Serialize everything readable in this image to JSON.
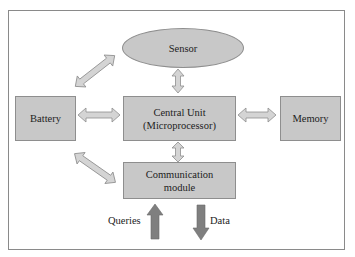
{
  "diagram": {
    "title": "",
    "nodes": {
      "sensor": "Sensor",
      "battery": "Battery",
      "central_unit_line1": "Central Unit",
      "central_unit_line2": "(Microprocessor)",
      "memory": "Memory",
      "comm_line1": "Communication",
      "comm_line2": "module"
    },
    "io_labels": {
      "queries": "Queries",
      "data": "Data"
    },
    "edges": [
      {
        "from": "Battery",
        "to": "Sensor",
        "type": "bidirectional"
      },
      {
        "from": "Battery",
        "to": "Central Unit",
        "type": "bidirectional"
      },
      {
        "from": "Battery",
        "to": "Communication module",
        "type": "bidirectional"
      },
      {
        "from": "Sensor",
        "to": "Central Unit",
        "type": "bidirectional"
      },
      {
        "from": "Central Unit",
        "to": "Memory",
        "type": "bidirectional"
      },
      {
        "from": "Central Unit",
        "to": "Communication module",
        "type": "bidirectional"
      },
      {
        "from": "Queries",
        "to": "Communication module",
        "type": "inbound"
      },
      {
        "from": "Communication module",
        "to": "Data",
        "type": "outbound"
      }
    ],
    "colors": {
      "node_fill": "#c8c8c8",
      "node_border": "#8e8e8e",
      "arrow_fill": "#d4d4d4",
      "io_arrow_fill": "#7f7f7f",
      "frame": "#8a8a8a"
    }
  }
}
